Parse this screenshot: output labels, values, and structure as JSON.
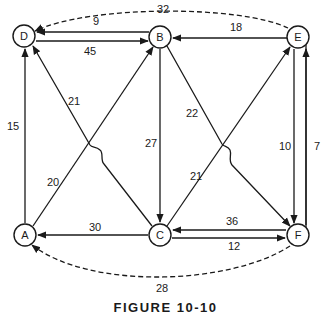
{
  "figure": {
    "caption": "FIGURE 10-10"
  },
  "nodes": [
    {
      "id": "D",
      "label": "D",
      "x": 24,
      "y": 36
    },
    {
      "id": "B",
      "label": "B",
      "x": 160,
      "y": 37
    },
    {
      "id": "E",
      "label": "E",
      "x": 298,
      "y": 37
    },
    {
      "id": "A",
      "label": "A",
      "x": 25,
      "y": 235
    },
    {
      "id": "C",
      "label": "C",
      "x": 160,
      "y": 235
    },
    {
      "id": "F",
      "label": "F",
      "x": 298,
      "y": 235
    }
  ],
  "edges": [
    {
      "from": "E",
      "to": "D",
      "weight": "32",
      "style": "dashed"
    },
    {
      "from": "B",
      "to": "D",
      "weight": "9"
    },
    {
      "from": "D",
      "to": "B",
      "weight": "45"
    },
    {
      "from": "E",
      "to": "B",
      "weight": "18"
    },
    {
      "from": "A",
      "to": "D",
      "weight": "15"
    },
    {
      "from": "C",
      "to": "D",
      "weight": "21"
    },
    {
      "from": "A",
      "to": "B",
      "weight": "20"
    },
    {
      "from": "B",
      "to": "C",
      "weight": "27"
    },
    {
      "from": "B",
      "to": "F",
      "weight": "22"
    },
    {
      "from": "C",
      "to": "E",
      "weight": "21"
    },
    {
      "from": "E",
      "to": "F",
      "weight": "10"
    },
    {
      "from": "F",
      "to": "E",
      "weight": "7"
    },
    {
      "from": "C",
      "to": "A",
      "weight": "30"
    },
    {
      "from": "F",
      "to": "C",
      "weight": "36"
    },
    {
      "from": "C",
      "to": "F",
      "weight": "12"
    },
    {
      "from": "F",
      "to": "A",
      "weight": "28",
      "style": "dashed"
    }
  ],
  "labels": {
    "w_ED": "32",
    "w_BD": "9",
    "w_DB": "45",
    "w_EB": "18",
    "w_AD": "15",
    "w_CD": "21",
    "w_AB": "20",
    "w_BC": "27",
    "w_BF": "22",
    "w_CE": "21",
    "w_EF": "10",
    "w_FE": "7",
    "w_CA": "30",
    "w_FC": "36",
    "w_CF": "12",
    "w_FA": "28"
  }
}
